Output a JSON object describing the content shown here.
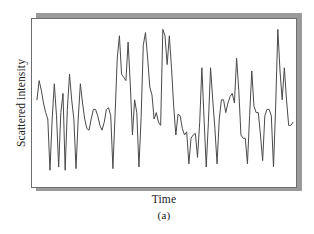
{
  "figure": {
    "caption": "(a)",
    "frame_color": "#6d6d6d",
    "shadow_color": "#9a9a9a",
    "background": "#ffffff"
  },
  "chart_data": {
    "type": "line",
    "title": "",
    "subtitle": "",
    "xlabel": "Time",
    "ylabel": "Scattered intensity",
    "grid": false,
    "legend": null,
    "line_color": "#4a4a4a",
    "line_width": 1,
    "xlim": [
      0,
      118
    ],
    "ylim": [
      0,
      100
    ],
    "x_tick_labels": [],
    "y_tick_labels": [],
    "annotations": [],
    "series": [
      {
        "name": "Scattered intensity",
        "x": [
          0,
          1,
          2,
          3,
          4,
          5,
          6,
          7,
          8,
          9,
          10,
          11,
          12,
          13,
          14,
          15,
          16,
          17,
          18,
          19,
          20,
          21,
          22,
          23,
          24,
          25,
          26,
          27,
          28,
          29,
          30,
          31,
          32,
          33,
          34,
          35,
          36,
          37,
          38,
          39,
          40,
          41,
          42,
          43,
          44,
          45,
          46,
          47,
          48,
          49,
          50,
          51,
          52,
          53,
          54,
          55,
          56,
          57,
          58,
          59,
          60,
          61,
          62,
          63,
          64,
          65,
          66,
          67,
          68,
          69,
          70,
          71,
          72,
          73,
          74,
          75,
          76,
          77,
          78,
          79,
          80,
          81,
          82,
          83,
          84,
          85,
          86,
          87,
          88,
          89,
          90,
          91,
          92,
          93,
          94,
          95,
          96,
          97,
          98,
          99,
          100,
          101,
          102,
          103,
          104,
          105,
          106,
          107,
          108,
          109,
          110,
          111,
          112,
          113,
          114,
          115,
          116,
          117,
          118
        ],
        "values": [
          52,
          64,
          58,
          50,
          44,
          40,
          8,
          40,
          62,
          42,
          10,
          44,
          56,
          8,
          46,
          68,
          52,
          40,
          9,
          40,
          62,
          50,
          40,
          34,
          33,
          40,
          46,
          46,
          42,
          36,
          33,
          38,
          46,
          47,
          42,
          9,
          43,
          78,
          92,
          68,
          66,
          64,
          88,
          62,
          30,
          52,
          44,
          10,
          41,
          86,
          94,
          78,
          60,
          55,
          40,
          44,
          38,
          36,
          96,
          92,
          74,
          92,
          72,
          48,
          30,
          43,
          42,
          34,
          30,
          32,
          12,
          28,
          30,
          31,
          16,
          38,
          72,
          40,
          10,
          38,
          72,
          52,
          34,
          12,
          40,
          52,
          52,
          44,
          50,
          54,
          56,
          50,
          78,
          58,
          30,
          28,
          28,
          12,
          42,
          70,
          48,
          44,
          44,
          30,
          14,
          42,
          46,
          46,
          42,
          10,
          48,
          96,
          70,
          52,
          72,
          52,
          36,
          36,
          38
        ]
      }
    ]
  }
}
